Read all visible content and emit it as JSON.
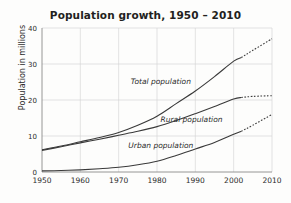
{
  "chart_data": {
    "type": "line",
    "title": "Population growth, 1950 – 2010",
    "xlabel": "",
    "ylabel": "Population in millions",
    "xlim": [
      1950,
      2010
    ],
    "ylim": [
      0,
      40
    ],
    "xticks": [
      "1950",
      "1960",
      "1970",
      "1980",
      "1990",
      "2000",
      "2010"
    ],
    "yticks": [
      "0",
      "10",
      "20",
      "30",
      "40"
    ],
    "grid": true,
    "legend_position": "inline-labels",
    "x": [
      1950,
      1955,
      1960,
      1965,
      1970,
      1975,
      1980,
      1985,
      1990,
      1995,
      2000,
      2002,
      2005,
      2010
    ],
    "series": [
      {
        "name": "Total population",
        "label": "Total population",
        "values": [
          6.2,
          7.2,
          8.4,
          9.6,
          11.0,
          13.0,
          15.5,
          19.0,
          22.5,
          26.5,
          30.8,
          31.8,
          33.8,
          37.0
        ],
        "solid_until_year": 2002,
        "projection_style": "dotted",
        "label_x": 1981,
        "label_y": 24.5
      },
      {
        "name": "Rural population",
        "label": "Rural population",
        "values": [
          6.0,
          7.0,
          8.1,
          9.1,
          10.2,
          11.3,
          12.6,
          14.3,
          16.2,
          18.2,
          20.3,
          20.7,
          21.0,
          21.2
        ],
        "solid_until_year": 2002,
        "projection_style": "dotted",
        "label_x": 1989,
        "label_y": 14.0
      },
      {
        "name": "Urban population",
        "label": "Urban population",
        "values": [
          0.3,
          0.4,
          0.6,
          0.9,
          1.3,
          2.0,
          3.0,
          4.6,
          6.4,
          8.2,
          10.5,
          11.3,
          13.0,
          16.0
        ],
        "solid_until_year": 2002,
        "projection_style": "dotted",
        "label_x": 1981,
        "label_y": 6.6
      }
    ],
    "colors": {
      "line": "#3a3a3a",
      "grid": "#d2d2d2",
      "axis": "#8a8a8a",
      "text": "#231f20",
      "background": "#fdfdfc"
    }
  }
}
